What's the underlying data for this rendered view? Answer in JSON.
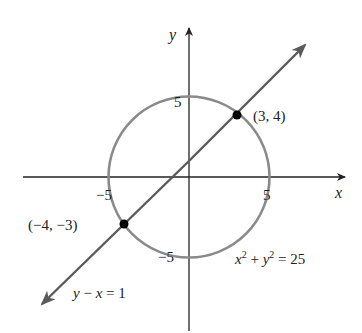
{
  "figure": {
    "axes": {
      "x_label": "x",
      "y_label": "y",
      "x_ticks": [
        {
          "value": -5,
          "label": "−5"
        },
        {
          "value": 5,
          "label": "5"
        }
      ],
      "y_ticks": [
        {
          "value": 5,
          "label": "5"
        },
        {
          "value": -5,
          "label": "−5"
        }
      ]
    },
    "circle": {
      "equation_parts": {
        "x": "x",
        "sup1": "2",
        "plus": " + ",
        "y": "y",
        "sup2": "2",
        "eq": " = 25"
      },
      "radius": 5,
      "color": "#8a8a8a"
    },
    "line": {
      "equation_parts": {
        "y": "y",
        "minus": " − ",
        "x": "x",
        "eq": " = 1"
      },
      "color": "#5a5a5a"
    },
    "points": [
      {
        "label": "(3, 4)",
        "x": 3,
        "y": 4
      },
      {
        "label": "(−4, −3)",
        "x": -4,
        "y": -3
      }
    ],
    "colors": {
      "axis": "#222222",
      "point": "#000000",
      "background": "#ffffff"
    }
  }
}
